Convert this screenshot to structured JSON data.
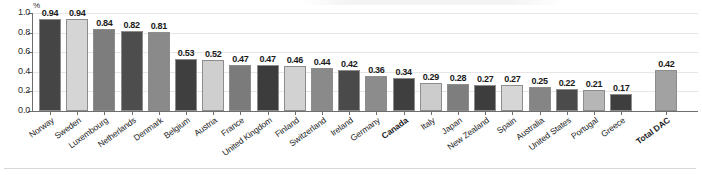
{
  "chart_data": {
    "type": "bar",
    "title": "",
    "xlabel": "",
    "ylabel": "%",
    "ylim": [
      0,
      1.0
    ],
    "ytick_labels": [
      "0.0",
      "0.2",
      "0.4",
      "0.6",
      "0.8",
      "1.0"
    ],
    "ytick_values": [
      0.0,
      0.2,
      0.4,
      0.6,
      0.8,
      1.0
    ],
    "grid": true,
    "legend": "none",
    "unit_symbol": "%",
    "categories": [
      "Norway",
      "Sweden",
      "Luxembourg",
      "Netherlands",
      "Denmark",
      "Belgium",
      "Austria",
      "France",
      "United Kingdom",
      "Finland",
      "Switzerland",
      "Ireland",
      "Germany",
      "Canada",
      "Italy",
      "Japan",
      "New Zealand",
      "Spain",
      "Australia",
      "United States",
      "Portugal",
      "Greece",
      "Total DAC"
    ],
    "values": [
      0.94,
      0.94,
      0.84,
      0.82,
      0.81,
      0.53,
      0.52,
      0.47,
      0.47,
      0.46,
      0.44,
      0.42,
      0.36,
      0.34,
      0.29,
      0.28,
      0.27,
      0.27,
      0.25,
      0.22,
      0.21,
      0.17,
      0.42
    ],
    "value_labels": [
      "0.94",
      "0.94",
      "0.84",
      "0.82",
      "0.81",
      "0.53",
      "0.52",
      "0.47",
      "0.47",
      "0.46",
      "0.44",
      "0.42",
      "0.36",
      "0.34",
      "0.29",
      "0.28",
      "0.27",
      "0.27",
      "0.25",
      "0.22",
      "0.21",
      "0.17",
      "0.42"
    ],
    "bar_colors": [
      "#454545",
      "#d5d5d5",
      "#7d7d7d",
      "#4d4d4d",
      "#8a8a8a",
      "#3f3f3f",
      "#cfcfcf",
      "#7b7b7b",
      "#3c3c3c",
      "#d2d2d2",
      "#8a8a8a",
      "#4a4a4a",
      "#8c8c8c",
      "#3f3f3f",
      "#cccccc",
      "#7e7e7e",
      "#3d3d3d",
      "#d6d6d6",
      "#858585",
      "#4b4b4b",
      "#b6b6b6",
      "#3e3e3e",
      "#a2a2a2"
    ],
    "emphasized_categories": [
      "Canada",
      "Total DAC"
    ],
    "separated_last_bar": true,
    "colors": {
      "dark": "#414141",
      "medium": "#838383",
      "light": "#d2d2d2",
      "axis": "#6e6e6e",
      "gridline": "#e6e6e6",
      "text": "#1a1a1a",
      "background": "#ffffff"
    }
  }
}
